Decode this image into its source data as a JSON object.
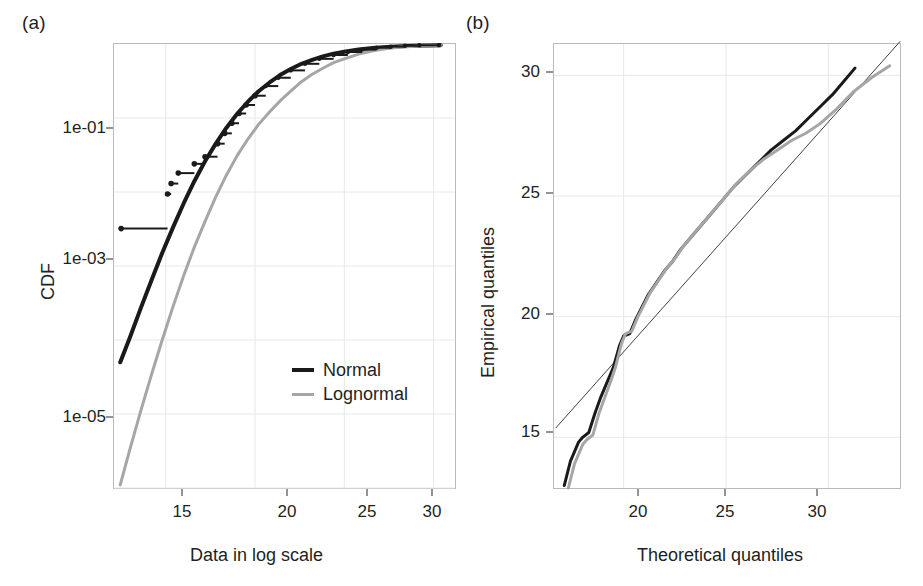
{
  "figure": {
    "background": "#ffffff",
    "frame_color": "#b9babc",
    "grid_color": "#e8e8ea",
    "series_colors": {
      "normal": "#1a1a1a",
      "lognormal": "#a6a6a6",
      "reference": "#404040",
      "empirical_points": "#1a1a1a"
    }
  },
  "panel_a": {
    "label": "(a)",
    "xlabel": "Data in log scale",
    "ylabel": "CDF",
    "xticks": [
      "15",
      "20",
      "25",
      "30"
    ],
    "yticks": [
      "1e-01",
      "1e-03",
      "1e-05"
    ],
    "legend": {
      "items": [
        {
          "label": "Normal",
          "color": "#1a1a1a",
          "width": 4
        },
        {
          "label": "Lognormal",
          "color": "#a6a6a6",
          "width": 3
        }
      ]
    }
  },
  "panel_b": {
    "label": "(b)",
    "xlabel": "Theoretical quantiles",
    "ylabel": "Empirical quantiles",
    "xticks": [
      "20",
      "25",
      "30"
    ],
    "yticks": [
      "30",
      "25",
      "20",
      "15"
    ]
  },
  "chart_data": [
    {
      "id": "panel_a",
      "type": "line",
      "title": "",
      "xlabel": "Data in log scale",
      "ylabel": "CDF",
      "xlim": [
        12.1,
        31.2
      ],
      "ylim_log": [
        1e-06,
        1.0
      ],
      "yscale": "log",
      "xscale": "linear",
      "grid": true,
      "xticks": [
        15,
        20,
        25,
        30
      ],
      "yticks": [
        0.1,
        0.001,
        1e-05
      ],
      "ytick_labels": [
        "1e-01",
        "1e-03",
        "1e-05"
      ],
      "legend_position": "bottom-right",
      "series": [
        {
          "name": "Normal",
          "color": "#1a1a1a",
          "style": "solid",
          "width": 4,
          "x": [
            12.45,
            13.0,
            13.6,
            14.2,
            14.8,
            15.4,
            16.0,
            16.6,
            17.2,
            17.8,
            18.4,
            19.0,
            19.6,
            20.2,
            20.8,
            21.4,
            22.0,
            22.6,
            23.2,
            23.8,
            24.4,
            25.0,
            25.8,
            26.6,
            27.4,
            28.2,
            29.0,
            29.8,
            30.4
          ],
          "y": [
            5e-05,
            0.00011,
            0.00027,
            0.00064,
            0.0015,
            0.0033,
            0.007,
            0.014,
            0.026,
            0.045,
            0.074,
            0.114,
            0.166,
            0.23,
            0.3,
            0.38,
            0.46,
            0.54,
            0.61,
            0.68,
            0.74,
            0.785,
            0.84,
            0.88,
            0.91,
            0.93,
            0.945,
            0.955,
            0.96
          ]
        },
        {
          "name": "Lognormal",
          "color": "#a6a6a6",
          "style": "solid",
          "width": 3,
          "x": [
            12.45,
            13.0,
            13.6,
            14.2,
            14.8,
            15.4,
            16.0,
            16.6,
            17.2,
            17.8,
            18.4,
            19.0,
            19.6,
            20.2,
            20.8,
            21.4,
            22.0,
            22.6,
            23.2,
            23.8,
            24.4,
            25.0,
            25.8,
            26.6,
            27.4,
            28.2,
            29.0,
            29.8,
            30.4
          ],
          "y": [
            1.1e-06,
            3.4e-06,
            1.1e-05,
            3.4e-05,
            0.0001,
            0.00028,
            0.00074,
            0.0018,
            0.004,
            0.0086,
            0.017,
            0.031,
            0.052,
            0.082,
            0.12,
            0.17,
            0.23,
            0.31,
            0.39,
            0.47,
            0.56,
            0.63,
            0.73,
            0.81,
            0.87,
            0.91,
            0.935,
            0.95,
            0.958
          ]
        },
        {
          "name": "Empirical CDF",
          "color": "#1a1a1a",
          "style": "step",
          "width": 2,
          "x": [
            12.5,
            15.1,
            15.3,
            15.7,
            16.6,
            17.2,
            17.9,
            18.3,
            18.7,
            19.1,
            19.5,
            20.0,
            20.6,
            21.3,
            22.0,
            22.8,
            23.6,
            24.4,
            25.2,
            26.0,
            26.8,
            27.6,
            28.4,
            29.2,
            30.3
          ],
          "y": [
            0.0032,
            0.0094,
            0.013,
            0.018,
            0.024,
            0.03,
            0.045,
            0.062,
            0.085,
            0.115,
            0.15,
            0.2,
            0.27,
            0.35,
            0.44,
            0.54,
            0.63,
            0.71,
            0.78,
            0.84,
            0.89,
            0.92,
            0.945,
            0.96,
            0.965
          ],
          "step_widths": [
            2.6,
            0.2,
            0.4,
            0.9,
            0.6,
            0.7,
            0.4,
            0.4,
            0.4,
            0.4,
            0.5,
            0.6,
            0.7,
            0.7,
            0.8,
            0.8,
            0.8,
            0.8,
            0.8,
            0.8,
            0.8,
            0.8,
            0.8,
            1.1,
            0.0
          ],
          "markers": "dot"
        }
      ]
    },
    {
      "id": "panel_b",
      "type": "line",
      "title": "",
      "xlabel": "Theoretical quantiles",
      "ylabel": "Empirical quantiles",
      "xlim": [
        16.6,
        33.5
      ],
      "ylim": [
        12.9,
        31.3
      ],
      "yscale": "linear",
      "xscale": "linear",
      "grid": true,
      "xticks": [
        20,
        25,
        30
      ],
      "yticks": [
        15,
        20,
        25,
        30
      ],
      "legend_position": "none",
      "series": [
        {
          "name": "Reference line",
          "color": "#404040",
          "style": "solid",
          "width": 1,
          "x": [
            16.7,
            33.5
          ],
          "y": [
            15.4,
            31.4
          ]
        },
        {
          "name": "Normal Q-Q",
          "color": "#1a1a1a",
          "style": "solid",
          "width": 3,
          "x": [
            17.1,
            17.4,
            17.8,
            18.0,
            18.3,
            18.6,
            18.9,
            19.2,
            19.5,
            19.8,
            20.0,
            20.3,
            20.6,
            20.9,
            21.2,
            21.6,
            22.0,
            22.4,
            22.8,
            23.3,
            23.8,
            24.3,
            24.8,
            25.4,
            26.0,
            26.6,
            27.2,
            27.8,
            28.4,
            29.0,
            29.6,
            30.2,
            30.8,
            31.3
          ],
          "y": [
            13.0,
            14.0,
            14.8,
            15.0,
            15.2,
            16.0,
            16.7,
            17.3,
            17.9,
            18.8,
            19.2,
            19.3,
            19.9,
            20.4,
            20.9,
            21.4,
            21.9,
            22.3,
            22.8,
            23.3,
            23.8,
            24.3,
            24.8,
            25.4,
            25.9,
            26.4,
            26.9,
            27.3,
            27.7,
            28.2,
            28.7,
            29.2,
            29.8,
            30.3
          ]
        },
        {
          "name": "Lognormal Q-Q",
          "color": "#a6a6a6",
          "style": "solid",
          "width": 3,
          "x": [
            17.3,
            17.6,
            18.0,
            18.2,
            18.5,
            18.8,
            19.1,
            19.4,
            19.6,
            19.9,
            20.1,
            20.4,
            20.7,
            21.0,
            21.3,
            21.7,
            22.1,
            22.5,
            22.9,
            23.4,
            23.9,
            24.4,
            24.9,
            25.5,
            26.1,
            26.8,
            27.5,
            28.2,
            28.9,
            29.6,
            30.4,
            31.2,
            32.1,
            33.0
          ],
          "y": [
            12.9,
            13.9,
            14.7,
            14.9,
            15.1,
            16.0,
            16.7,
            17.4,
            17.9,
            18.9,
            19.3,
            19.4,
            20.0,
            20.5,
            21.0,
            21.5,
            22.0,
            22.4,
            22.9,
            23.4,
            23.9,
            24.4,
            24.9,
            25.5,
            26.0,
            26.5,
            26.9,
            27.3,
            27.6,
            28.0,
            28.6,
            29.3,
            29.9,
            30.4
          ]
        }
      ]
    }
  ]
}
